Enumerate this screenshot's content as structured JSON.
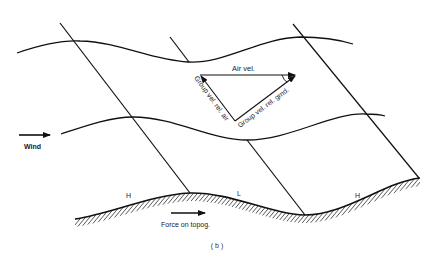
{
  "figure": {
    "caption": "(b)",
    "labels": {
      "air_velocity": "Air vel.",
      "group_vel_rel_air": "Group vel. rel. air",
      "group_vel_rel_ground": "Group vel. rel. grnd.",
      "wind": "Wind",
      "force_on_topography": "Force on topog.",
      "high_left": "H",
      "low_middle": "L",
      "high_right": "H"
    },
    "icons": {
      "wind_arrow": "right-arrow",
      "force_arrow": "right-arrow"
    },
    "colors": {
      "line": "#111111",
      "background": "#ffffff"
    }
  }
}
